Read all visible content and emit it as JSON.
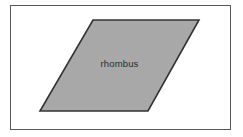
{
  "figure": {
    "title": "rhombus",
    "canvas": {
      "width": 243,
      "height": 137,
      "background": "#ffffff"
    },
    "frame": {
      "name": "figure-border",
      "x": 10,
      "y": 5,
      "width": 221,
      "height": 125,
      "stroke": "#58585a",
      "stroke_width": 1,
      "fill": "#ffffff"
    },
    "shape": {
      "name": "rhombus",
      "type": "parallelogram",
      "points": "93,20 199,20 148,111 40,111",
      "vertices": [
        {
          "label": "top-left",
          "x": 93,
          "y": 20
        },
        {
          "label": "top-right",
          "x": 199,
          "y": 20
        },
        {
          "label": "bottom-right",
          "x": 148,
          "y": 111
        },
        {
          "label": "bottom-left",
          "x": 40,
          "y": 111
        }
      ],
      "fill": "#a8a8a8",
      "stroke": "#333333",
      "stroke_width": 1.6
    },
    "label": {
      "text": "rhombus",
      "color": "#2b2b2b",
      "font_size_px": 9.5,
      "center_x": 120,
      "center_y": 64
    }
  }
}
